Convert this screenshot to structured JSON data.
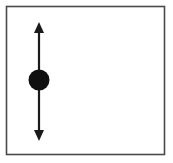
{
  "figure": {
    "title": "Vertical double-headed arrow through a filled circle",
    "description": "A square outlined panel containing a black filled circle (particle) with a vertical double-headed arrow passing through its center, indicating motion or force along the vertical axis.",
    "canvas": {
      "width": 173,
      "height": 163,
      "background": "#ffffff"
    }
  },
  "panel": {
    "name": "frame",
    "x": 6.5,
    "y": 6.5,
    "width": 158,
    "height": 148,
    "stroke": "#4a4a4a",
    "stroke_width": 1.6,
    "fill": "#ffffff"
  },
  "arrow": {
    "label": "vertical double-headed arrow",
    "orientation": "vertical",
    "x": 39,
    "y_top_tip": 22,
    "y_bottom_tip": 141,
    "shaft_top": 32,
    "shaft_bottom": 131,
    "shaft_width": 2.2,
    "head_width": 10,
    "head_length": 11,
    "color": "#1a1a1a"
  },
  "circle": {
    "label": "filled circle particle",
    "cx": 39,
    "cy": 80,
    "r": 10.5,
    "fill": "#101010",
    "stroke": "none"
  },
  "colors": {
    "ink": "#1a1a1a",
    "frame_stroke": "#4a4a4a",
    "background": "#ffffff"
  }
}
